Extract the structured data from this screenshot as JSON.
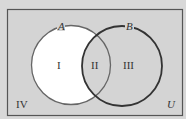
{
  "diagram": {
    "type": "venn",
    "universe_label": "U",
    "sets": [
      {
        "name": "A",
        "label": "A"
      },
      {
        "name": "B",
        "label": "B"
      }
    ],
    "regions": [
      {
        "id": "I",
        "label": "I",
        "description": "A only",
        "shaded": false
      },
      {
        "id": "II",
        "label": "II",
        "description": "A and B",
        "shaded": true
      },
      {
        "id": "III",
        "label": "III",
        "description": "B only",
        "shaded": true
      },
      {
        "id": "IV",
        "label": "IV",
        "description": "outside A and B",
        "shaded": true
      }
    ],
    "colors": {
      "background": "#d8d8d8",
      "shaded": "#d4d4d4",
      "unshaded": "#ffffff",
      "border": "#555555",
      "circle_a": "#666666",
      "circle_b": "#333333"
    }
  }
}
